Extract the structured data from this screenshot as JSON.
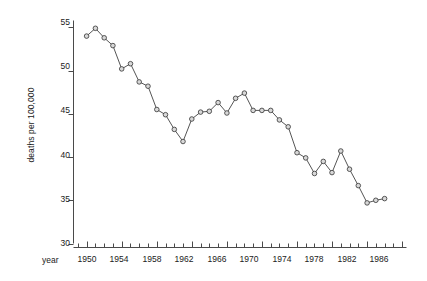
{
  "chart_data": {
    "type": "line",
    "title": "",
    "subtitle": "",
    "xlabel": "year",
    "ylabel": "deaths per 100,000",
    "xlim": [
      1948.5,
      1986.5
    ],
    "ylim": [
      30,
      55.8
    ],
    "grid": false,
    "legend": "none",
    "marker": "open-circle",
    "line_color": "#555555",
    "marker_fill": "#d8d8d8",
    "marker_edge": "#333333",
    "x": [
      1950,
      1951,
      1952,
      1953,
      1954,
      1955,
      1956,
      1957,
      1958,
      1959,
      1960,
      1961,
      1962,
      1963,
      1964,
      1965,
      1966,
      1967,
      1968,
      1969,
      1970,
      1971,
      1972,
      1973,
      1974,
      1975,
      1976,
      1977,
      1978,
      1979,
      1980,
      1981,
      1982,
      1983,
      1984
    ],
    "values": [
      54.0,
      54.9,
      53.8,
      52.9,
      50.2,
      50.8,
      48.7,
      48.2,
      45.5,
      44.9,
      43.2,
      41.8,
      44.4,
      45.2,
      45.3,
      46.3,
      45.1,
      46.8,
      47.4,
      45.4,
      45.4,
      45.4,
      44.3,
      43.5,
      40.5,
      39.9,
      38.1,
      39.5,
      38.2,
      40.7,
      38.6,
      36.7,
      34.7,
      35.0,
      35.2
    ],
    "series": [
      {
        "name": "deaths per 100,000",
        "values": [
          54.0,
          54.9,
          53.8,
          52.9,
          50.2,
          50.8,
          48.7,
          48.2,
          45.5,
          44.9,
          43.2,
          41.8,
          44.4,
          45.2,
          45.3,
          46.3,
          45.1,
          46.8,
          47.4,
          45.4,
          45.4,
          45.4,
          44.3,
          43.5,
          40.5,
          39.9,
          38.1,
          39.5,
          38.2,
          40.7,
          38.6,
          36.7,
          34.7,
          35.0,
          35.2
        ]
      }
    ],
    "yticks": [
      30,
      35,
      40,
      45,
      50,
      55
    ],
    "ytick_labels": [
      "30",
      "35",
      "40",
      "45",
      "50",
      "55"
    ],
    "xticks": [
      1950,
      1954,
      1958,
      1962,
      1966,
      1970,
      1974,
      1978,
      1982,
      1986
    ],
    "xtick_labels": [
      "1950",
      "1954",
      "1958",
      "1962",
      "1966",
      "1970",
      "1974",
      "1978",
      "1982",
      "1986"
    ],
    "xtick_minor_start": 1949,
    "xtick_minor_end": 1986,
    "xtick_minor_step": 1
  }
}
